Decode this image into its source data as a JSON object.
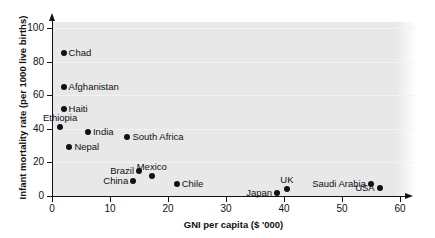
{
  "chart_data": {
    "type": "scatter",
    "title": "",
    "xlabel": "GNI per capita ($ '000)",
    "ylabel": "Infant mortality rate (per 1000 live births)",
    "xlim": [
      0,
      60
    ],
    "ylim": [
      0,
      105
    ],
    "xticks": [
      0,
      10,
      20,
      30,
      40,
      50,
      60
    ],
    "yticks": [
      0,
      20,
      40,
      60,
      80,
      100
    ],
    "xtick_labels": [
      "0",
      "10",
      "20",
      "30",
      "40",
      "50",
      "60"
    ],
    "ytick_labels": [
      "0",
      "20",
      "40",
      "60",
      "80",
      "100"
    ],
    "grid": true,
    "legend": "none",
    "points": [
      {
        "label": "Chad",
        "x": 2.0,
        "y": 85,
        "label_pos": "right"
      },
      {
        "label": "Afghanistan",
        "x": 2.0,
        "y": 65,
        "label_pos": "right"
      },
      {
        "label": "Haiti",
        "x": 2.0,
        "y": 52,
        "label_pos": "right"
      },
      {
        "label": "Ethiopia",
        "x": 1.4,
        "y": 41,
        "label_pos": "above"
      },
      {
        "label": "India",
        "x": 6.2,
        "y": 38,
        "label_pos": "right"
      },
      {
        "label": "South Africa",
        "x": 13.0,
        "y": 35,
        "label_pos": "right"
      },
      {
        "label": "Nepal",
        "x": 3.0,
        "y": 29,
        "label_pos": "right"
      },
      {
        "label": "Brazil",
        "x": 15.0,
        "y": 15,
        "label_pos": "left"
      },
      {
        "label": "Mexico",
        "x": 17.2,
        "y": 12,
        "label_pos": "above"
      },
      {
        "label": "China",
        "x": 14.0,
        "y": 9,
        "label_pos": "left"
      },
      {
        "label": "Chile",
        "x": 21.5,
        "y": 7,
        "label_pos": "right"
      },
      {
        "label": "Saudi Arabia",
        "x": 55.0,
        "y": 7,
        "label_pos": "left"
      },
      {
        "label": "USA",
        "x": 56.5,
        "y": 5,
        "label_pos": "left"
      },
      {
        "label": "UK",
        "x": 40.5,
        "y": 4,
        "label_pos": "above"
      },
      {
        "label": "Japan",
        "x": 38.8,
        "y": 2,
        "label_pos": "left"
      }
    ],
    "colors": {
      "marker": "#111111",
      "panel_background": "#e8e8e8",
      "gridline": "#f2f2f2",
      "axis": "#111111",
      "page_background": "#ffffff"
    }
  }
}
